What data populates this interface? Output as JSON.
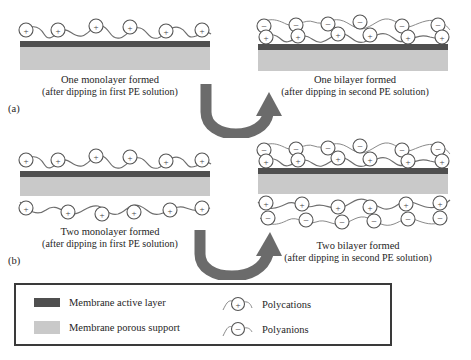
{
  "figure": {
    "type": "schematic-diagram"
  },
  "panels": [
    {
      "label": "(a)",
      "stage": "one-monolayer",
      "caption_main": "One monolayer formed",
      "caption_sub": "(after dipping in first PE solution)",
      "top_layers": [
        "polycations"
      ],
      "bottom_layers": [],
      "membrane_sides": "top-only"
    },
    {
      "label": "",
      "stage": "one-bilayer",
      "caption_main": "One bilayer formed",
      "caption_sub": "(after dipping in second PE solution)",
      "top_layers": [
        "polycations",
        "polyanions"
      ],
      "bottom_layers": [],
      "membrane_sides": "top-only"
    },
    {
      "label": "(b)",
      "stage": "two-monolayer",
      "caption_main": "Two monolayer formed",
      "caption_sub": "(after dipping in first PE solution)",
      "top_layers": [
        "polycations"
      ],
      "bottom_layers": [
        "polycations"
      ],
      "membrane_sides": "both"
    },
    {
      "label": "",
      "stage": "two-bilayer",
      "caption_main": "Two bilayer formed",
      "caption_sub": "(after dipping in second PE solution)",
      "top_layers": [
        "polycations",
        "polyanions"
      ],
      "bottom_layers": [
        "polycations",
        "polyanions"
      ],
      "membrane_sides": "both"
    }
  ],
  "legend": {
    "items": [
      {
        "key": "active-layer",
        "swatch_color": "#4f4f4f",
        "label": "Membrane active layer"
      },
      {
        "key": "porous-support",
        "swatch_color": "#c9c9c9",
        "label": "Membrane porous support"
      },
      {
        "key": "polycations",
        "symbol": "+",
        "label": "Polycations"
      },
      {
        "key": "polyanions",
        "symbol": "−",
        "label": "Polyanions"
      }
    ]
  },
  "colors": {
    "active_layer": "#4f4f4f",
    "porous_support": "#c9c9c9",
    "arrow": "#6b6b6b",
    "chain": "#6e6e6e",
    "circle_stroke": "#555555",
    "legend_border": "#3a3a3a"
  },
  "charge_symbols": {
    "positive": "+",
    "negative": "−"
  }
}
